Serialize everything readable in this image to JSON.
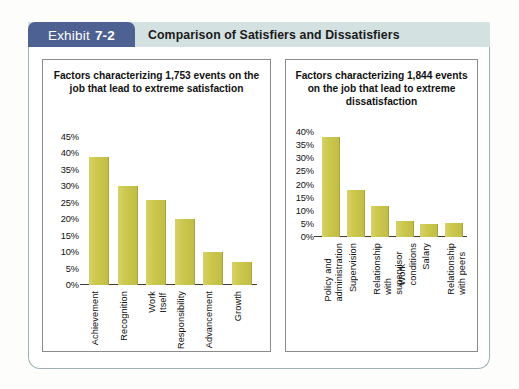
{
  "header": {
    "exhibit_word": "Exhibit",
    "exhibit_number": "7-2",
    "title": "Comparison of Satisfiers and Dissatisfiers"
  },
  "chart_data": [
    {
      "type": "bar",
      "panel": "left",
      "title": "Factors characterizing 1,753 events on the job that lead to extreme satisfaction",
      "categories": [
        "Achievement",
        "Recognition",
        "Work Itself",
        "Responsibility",
        "Advancement",
        "Growth"
      ],
      "values": [
        39,
        30,
        26,
        20,
        10,
        7
      ],
      "yticks": [
        "45%",
        "40%",
        "35%",
        "30%",
        "25%",
        "20%",
        "15%",
        "10%",
        "5%",
        "0%"
      ],
      "ytick_values": [
        45,
        40,
        35,
        30,
        25,
        20,
        15,
        10,
        5,
        0
      ],
      "ylim": [
        0,
        45
      ],
      "xlabel": "",
      "ylabel": "",
      "grid": false,
      "legend": false,
      "bar_color": "#cdc94e"
    },
    {
      "type": "bar",
      "panel": "right",
      "title": "Factors characterizing 1,844 events on the job that lead to extreme dissatisfaction",
      "categories": [
        "Policy and administration",
        "Supervision",
        "Relationship with\nsupervisor",
        "Work conditions",
        "Salary",
        "Relationship with peers"
      ],
      "values": [
        38,
        18,
        12,
        6,
        5,
        5.5
      ],
      "yticks": [
        "40%",
        "35%",
        "30%",
        "25%",
        "20%",
        "15%",
        "10%",
        "5%",
        "0%"
      ],
      "ytick_values": [
        40,
        35,
        30,
        25,
        20,
        15,
        10,
        5,
        0
      ],
      "ylim": [
        0,
        40
      ],
      "xlabel": "",
      "ylabel": "",
      "grid": false,
      "legend": false,
      "bar_color": "#cdc94e"
    }
  ]
}
